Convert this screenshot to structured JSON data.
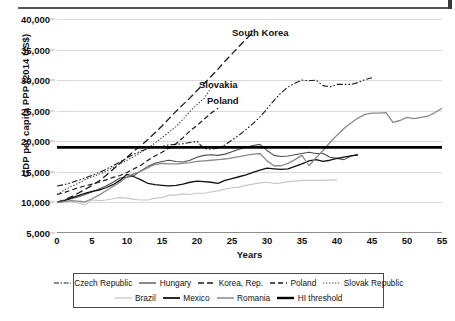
{
  "figure": {
    "y_axis_title": "GDP per capita PPP (2014 US$)",
    "x_axis_title": "Years"
  },
  "annotations": [
    {
      "id": "south-korea",
      "text": "South Korea",
      "x": 232,
      "y": 27
    },
    {
      "id": "slovakia",
      "text": "Slovakia",
      "x": 199,
      "y": 79
    },
    {
      "id": "poland",
      "text": "Poland",
      "x": 207,
      "y": 95
    }
  ],
  "legend": {
    "rows": [
      [
        {
          "key": "czech-republic",
          "label": "Czech Republic",
          "style": "dashdotdot"
        },
        {
          "key": "hungary",
          "label": "Hungary",
          "style": "solid-dark"
        },
        {
          "key": "korea-rep",
          "label": "Korea, Rep.",
          "style": "dash-long"
        },
        {
          "key": "poland",
          "label": "Poland",
          "style": "dash-med"
        },
        {
          "key": "slovak-republic",
          "label": "Slovak Republic",
          "style": "dotted"
        }
      ],
      [
        {
          "key": "brazil",
          "label": "Brazil",
          "style": "solid-light"
        },
        {
          "key": "mexico",
          "label": "Mexico",
          "style": "solid-black"
        },
        {
          "key": "romania",
          "label": "Romania",
          "style": "solid-gray"
        },
        {
          "key": "hi-threshold",
          "label": "HI threshold",
          "style": "solid-thick"
        }
      ]
    ]
  },
  "chart_data": {
    "type": "line",
    "title": "",
    "xlabel": "Years",
    "ylabel": "GDP per capita PPP (2014 US$)",
    "xlim": [
      0,
      55
    ],
    "ylim": [
      5000,
      40000
    ],
    "xticks": [
      0,
      5,
      10,
      15,
      20,
      25,
      30,
      35,
      40,
      45,
      50,
      55
    ],
    "yticks": [
      5000,
      10000,
      15000,
      20000,
      25000,
      30000,
      35000,
      40000
    ],
    "ytick_labels": [
      "5,000",
      "10,000",
      "15,000",
      "20,000",
      "25,000",
      "30,000",
      "35,000",
      "40,000"
    ],
    "grid": "horizontal",
    "legend_position": "below",
    "annotations": [
      "South Korea",
      "Slovakia",
      "Poland"
    ],
    "threshold": {
      "name": "HI threshold",
      "value": 19000
    },
    "series": [
      {
        "name": "Czech Republic",
        "style": "dash-dot-dot",
        "color": "#1a1a1a",
        "x": [
          0,
          1,
          2,
          3,
          4,
          5,
          6,
          7,
          8,
          9,
          10,
          11,
          12,
          13,
          14,
          15,
          16,
          17,
          18,
          19,
          20,
          21,
          22,
          23,
          24,
          25,
          26,
          27,
          28,
          29,
          30,
          31,
          32,
          33,
          34,
          35,
          36,
          37,
          38,
          39,
          40,
          41,
          42,
          43,
          44,
          45
        ],
        "y": [
          12700,
          12900,
          13200,
          13600,
          14000,
          14400,
          14900,
          15400,
          16000,
          16600,
          17300,
          17900,
          18400,
          18800,
          19000,
          19200,
          19400,
          19500,
          19600,
          19800,
          20000,
          18800,
          18700,
          18900,
          19400,
          20200,
          21000,
          21900,
          22900,
          24000,
          25300,
          26700,
          27900,
          28900,
          29500,
          30000,
          29900,
          30000,
          29100,
          28900,
          29300,
          29300,
          29300,
          29600,
          30100,
          30400
        ]
      },
      {
        "name": "Hungary",
        "style": "solid-medium",
        "color": "#4d4d4d",
        "x": [
          0,
          1,
          2,
          3,
          4,
          5,
          6,
          7,
          8,
          9,
          10,
          11,
          12,
          13,
          14,
          15,
          16,
          17,
          18,
          19,
          20,
          21,
          22,
          23,
          24,
          25,
          26,
          27,
          28,
          29,
          30,
          31,
          32,
          33,
          34,
          35,
          36,
          37,
          38,
          39,
          40,
          41,
          42,
          43
        ],
        "y": [
          10100,
          10300,
          10600,
          10900,
          11300,
          11700,
          12200,
          12700,
          13300,
          14000,
          14100,
          14400,
          15200,
          15900,
          16400,
          16700,
          16900,
          16700,
          16600,
          16900,
          17400,
          17700,
          17800,
          17700,
          17900,
          18300,
          18700,
          19000,
          19300,
          19500,
          18500,
          17700,
          17500,
          17600,
          17800,
          18000,
          18200,
          18000,
          18000,
          17400,
          17200,
          17000,
          17600,
          17800
        ]
      },
      {
        "name": "Korea, Rep.",
        "style": "dash-long",
        "color": "#1a1a1a",
        "x": [
          0,
          1,
          2,
          3,
          4,
          5,
          6,
          7,
          8,
          9,
          10,
          11,
          12,
          13,
          14,
          15,
          16,
          17,
          18,
          19,
          20,
          21,
          22,
          23,
          24,
          25,
          26,
          27,
          28
        ],
        "y": [
          10000,
          10400,
          10900,
          11500,
          12100,
          12800,
          13500,
          14400,
          15400,
          16400,
          17400,
          18400,
          19300,
          20300,
          21400,
          22500,
          23700,
          24900,
          26000,
          27100,
          28300,
          29400,
          30600,
          31800,
          33100,
          34300,
          35500,
          36700,
          37800
        ]
      },
      {
        "name": "Poland",
        "style": "dash-medium",
        "color": "#1a1a1a",
        "x": [
          0,
          1,
          2,
          3,
          4,
          5,
          6,
          7,
          8,
          9,
          10,
          11,
          12,
          13,
          14,
          15,
          16,
          17,
          18,
          19,
          20,
          21,
          22,
          23
        ],
        "y": [
          11300,
          11600,
          12000,
          12400,
          12700,
          13000,
          13300,
          13700,
          14100,
          14400,
          14900,
          15500,
          16100,
          16900,
          17600,
          18200,
          18900,
          19600,
          20600,
          21700,
          22600,
          23600,
          24600,
          25400
        ]
      },
      {
        "name": "Slovak Republic",
        "style": "dotted",
        "color": "#3a3a3a",
        "x": [
          0,
          1,
          2,
          3,
          4,
          5,
          6,
          7,
          8,
          9,
          10,
          11,
          12,
          13,
          14,
          15,
          16,
          17,
          18,
          19,
          20,
          21,
          22
        ],
        "y": [
          11300,
          12000,
          12600,
          13100,
          13700,
          14200,
          14600,
          15100,
          15700,
          16300,
          16900,
          17500,
          18200,
          18900,
          19700,
          20600,
          21500,
          22400,
          23600,
          24900,
          26000,
          27000,
          28700
        ]
      },
      {
        "name": "Brazil",
        "style": "solid-light",
        "color": "#c6c6c6",
        "x": [
          0,
          1,
          2,
          3,
          4,
          5,
          6,
          7,
          8,
          9,
          10,
          11,
          12,
          13,
          14,
          15,
          16,
          17,
          18,
          19,
          20,
          21,
          22,
          23,
          24,
          25,
          26,
          27,
          28,
          29,
          30,
          31,
          32,
          33,
          34,
          35,
          36,
          37,
          38,
          39,
          40
        ],
        "y": [
          10000,
          10300,
          10300,
          9900,
          9600,
          10400,
          10300,
          10400,
          10600,
          10800,
          10700,
          10500,
          10400,
          10400,
          10700,
          10800,
          11200,
          11200,
          11400,
          11300,
          11500,
          11500,
          11700,
          11900,
          12200,
          12400,
          12500,
          12800,
          13000,
          13200,
          13300,
          13100,
          13200,
          13400,
          13500,
          13600,
          13600,
          13600,
          13600,
          13650,
          13700
        ]
      },
      {
        "name": "Mexico",
        "style": "solid-black",
        "color": "#111111",
        "x": [
          0,
          1,
          2,
          3,
          4,
          5,
          6,
          7,
          8,
          9,
          10,
          11,
          12,
          13,
          14,
          15,
          16,
          17,
          18,
          19,
          20,
          21,
          22,
          23,
          24,
          25,
          26,
          27,
          28,
          29,
          30,
          31,
          32,
          33,
          34,
          35,
          36,
          37,
          38,
          39,
          40,
          41,
          42,
          43
        ],
        "y": [
          10000,
          10300,
          10700,
          11100,
          11500,
          11800,
          12000,
          12400,
          12900,
          13600,
          14600,
          14200,
          13700,
          13100,
          12900,
          12800,
          12700,
          12800,
          13000,
          13300,
          13500,
          13400,
          13300,
          13100,
          13600,
          13900,
          14200,
          14500,
          14900,
          15300,
          15600,
          15500,
          15400,
          15500,
          15900,
          16300,
          16800,
          17000,
          16700,
          16900,
          17200,
          17400,
          17600,
          17800
        ]
      },
      {
        "name": "Romania",
        "style": "solid-gray",
        "color": "#8a8a8a",
        "x": [
          0,
          1,
          2,
          3,
          4,
          5,
          6,
          7,
          8,
          9,
          10,
          11,
          12,
          13,
          14,
          15,
          16,
          17,
          18,
          19,
          20,
          21,
          22,
          23,
          24,
          25,
          26,
          27,
          28,
          29,
          30,
          31,
          32,
          33,
          34,
          35,
          36,
          37,
          38,
          39,
          40,
          41,
          42,
          43,
          44,
          45,
          46,
          47,
          48,
          49,
          50,
          51,
          52,
          53,
          54,
          55
        ],
        "y": [
          10000,
          10100,
          10300,
          10200,
          10100,
          10600,
          11200,
          11900,
          12600,
          13300,
          14200,
          14700,
          15100,
          15700,
          16200,
          16400,
          16300,
          16300,
          16400,
          16500,
          16700,
          16800,
          16900,
          17000,
          17100,
          17300,
          17500,
          17700,
          17900,
          18000,
          16800,
          16000,
          16000,
          16400,
          17000,
          17700,
          16000,
          17300,
          18500,
          19800,
          21000,
          22100,
          23000,
          23800,
          24400,
          24600,
          24600,
          24700,
          23100,
          23400,
          23900,
          23700,
          23900,
          24100,
          24700,
          25400
        ]
      },
      {
        "name": "HI threshold",
        "style": "solid-thick",
        "color": "#000000",
        "x": [
          0,
          55
        ],
        "y": [
          19000,
          19000
        ]
      }
    ]
  }
}
